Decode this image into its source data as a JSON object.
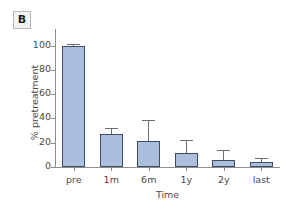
{
  "panel": {
    "label": "B"
  },
  "chart_data": {
    "type": "bar",
    "title": "",
    "subtitle": "",
    "xlabel": "Time",
    "ylabel": "% pretreatment",
    "categories": [
      "pre",
      "1m",
      "6m",
      "1y",
      "2y",
      "last"
    ],
    "values": [
      100,
      27.5,
      21.5,
      11.5,
      6,
      4.5
    ],
    "errors": [
      1,
      5,
      17,
      11,
      8,
      3
    ],
    "error_type": "upper-only-whisker",
    "yticks": [
      0,
      20,
      40,
      60,
      80,
      100
    ],
    "yticklabels": [
      "0",
      "20",
      "40",
      "60",
      "80",
      "100"
    ],
    "ylim": [
      0,
      108
    ],
    "xlim_categories": 6,
    "grid": false,
    "legend": null,
    "legend_position": "none",
    "colors": {
      "bar_fill": "#a9bfdd",
      "bar_edge": "#3f4a63",
      "error_bar": "#6f6f6f",
      "axis": "#8d8d8d",
      "text": "#4a4a4a",
      "panel_label_bg": "#f2f2f2",
      "panel_label_border": "#b9b9b9",
      "background": "#ffffff"
    }
  }
}
